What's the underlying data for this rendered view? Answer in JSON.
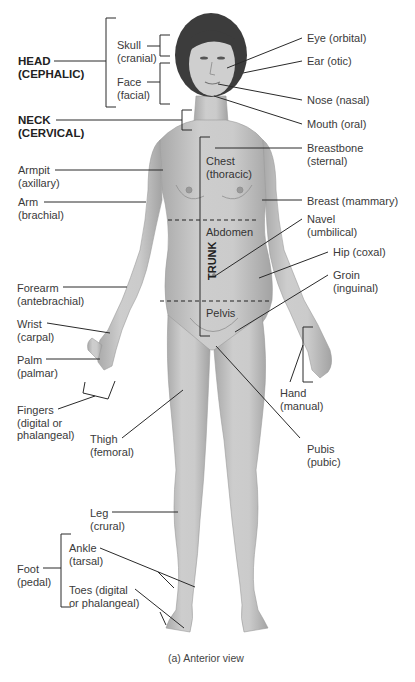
{
  "figure": {
    "caption": "(a) Anterior view",
    "view": "anterior",
    "skin_color": "#c4c4c4",
    "hair_color": "#3c3c3c",
    "line_color": "#2a2a2a"
  },
  "regions": {
    "head": "HEAD\n(CEPHALIC)",
    "neck": "NECK\n(CERVICAL)",
    "trunk": "TRUNK"
  },
  "labels_left": {
    "skull": "Skull\n(cranial)",
    "face": "Face\n(facial)",
    "armpit": "Armpit\n(axillary)",
    "arm": "Arm\n(brachial)",
    "forearm": "Forearm\n(antebrachial)",
    "wrist": "Wrist\n(carpal)",
    "palm": "Palm\n(palmar)",
    "fingers": "Fingers\n(digital or\nphalangeal)",
    "thigh": "Thigh\n(femoral)",
    "leg": "Leg\n(crural)",
    "foot": "Foot\n(pedal)",
    "ankle": "Ankle\n(tarsal)",
    "toes": "Toes (digital\nor phalangeal)"
  },
  "labels_body": {
    "chest": "Chest\n(thoracic)",
    "abdomen": "Abdomen",
    "pelvis": "Pelvis"
  },
  "labels_right": {
    "eye": "Eye (orbital)",
    "ear": "Ear (otic)",
    "nose": "Nose (nasal)",
    "mouth": "Mouth (oral)",
    "breastbone": "Breastbone\n(sternal)",
    "breast": "Breast (mammary)",
    "navel": "Navel\n(umbilical)",
    "hip": "Hip (coxal)",
    "groin": "Groin\n(inguinal)",
    "hand": "Hand\n(manual)",
    "pubis": "Pubis\n(pubic)"
  }
}
